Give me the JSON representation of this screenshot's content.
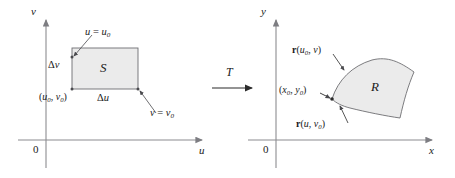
{
  "figure": {
    "caption": "Transformation T maps rectangle S in the uv-plane onto region R in the xy-plane",
    "ink_color": "#2b2b2b",
    "axis_color": "#8c8c90",
    "region_fill": "#ebebeb",
    "region_stroke": "#6e6e72"
  },
  "left_panel": {
    "name": "uv-plane",
    "axis_vertical_label": "v",
    "axis_horizontal_label": "u",
    "origin_label": "0",
    "region_label": "S",
    "labels": {
      "u_equals": {
        "lhs": "u",
        "eq": " = ",
        "base": "u",
        "sub": "0"
      },
      "v_equals": {
        "lhs": "v",
        "eq": " = ",
        "base": "v",
        "sub": "0"
      },
      "delta_v": {
        "delta": "Δ",
        "var": "v"
      },
      "delta_u": {
        "delta": "Δ",
        "var": "u"
      },
      "corner_point": {
        "open": "(",
        "x_base": "u",
        "x_sub": "0",
        "comma": ", ",
        "y_base": "v",
        "y_sub": "0",
        "close": ")"
      }
    }
  },
  "arrow": {
    "label": "T",
    "direction": "right"
  },
  "right_panel": {
    "name": "xy-plane",
    "axis_vertical_label": "y",
    "axis_horizontal_label": "x",
    "origin_label": "0",
    "region_label": "R",
    "labels": {
      "r_u0_v": {
        "vec": "r",
        "open": "(",
        "a_base": "u",
        "a_sub": "0",
        "comma": ", ",
        "b_base": "v",
        "b_sub": "",
        "close": ")"
      },
      "r_u_v0": {
        "vec": "r",
        "open": "(",
        "a_base": "u",
        "a_sub": "",
        "comma": ", ",
        "b_base": "v",
        "b_sub": "0",
        "close": ")"
      },
      "corner_point": {
        "open": "(",
        "x_base": "x",
        "x_sub": "0",
        "comma": ", ",
        "y_base": "y",
        "y_sub": "0",
        "close": ")"
      }
    }
  }
}
